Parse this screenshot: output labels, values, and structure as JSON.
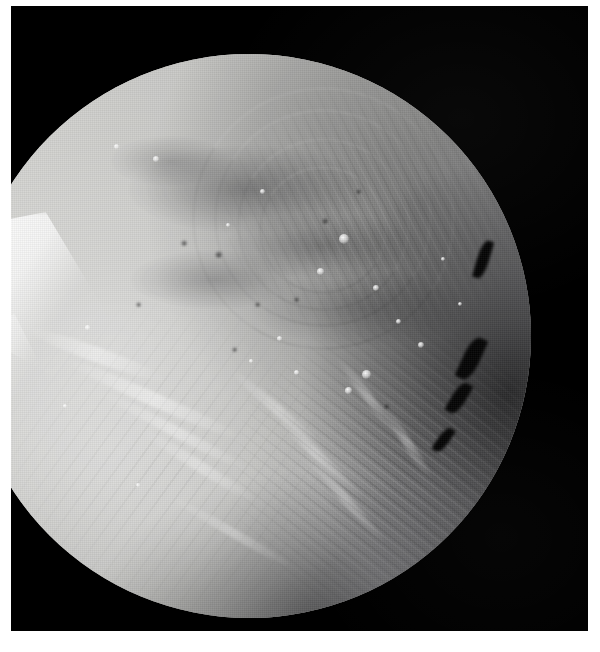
{
  "page": {
    "width": 600,
    "height": 652,
    "background_color": "#ffffff",
    "margin_color": "#ffffff",
    "caption": ""
  },
  "image": {
    "kind": "photograph",
    "subject": "planetary-moon",
    "color_mode": "grayscale",
    "frame": {
      "left": 11,
      "top": 6,
      "width": 577,
      "height": 625,
      "background_color": "#000000"
    },
    "body": {
      "shape": "sphere",
      "center_x": 238,
      "center_y": 330,
      "radius": 282,
      "base_color": "#b9b9b7",
      "highlight_color": "#e8e8e6",
      "shadow_color": "#2a2a2c",
      "illumination_direction": "upper-left",
      "terminator_side": "right"
    },
    "features": {
      "bright_chevron": {
        "name": "bright-scarp-chevron",
        "position": "west-limb-upper",
        "brightness": "#ffffff"
      },
      "dark_bands": {
        "name": "dark-corona-banding",
        "position": "upper-middle",
        "brightness": "#6f6f73"
      },
      "grooved_terrain_ne": {
        "name": "ridged-grooved-terrain",
        "position": "northeast"
      },
      "grooved_terrain_se": {
        "name": "ridged-grooved-terrain",
        "position": "southeast-limb"
      },
      "smooth_plain": {
        "name": "bright-smooth-plain",
        "position": "southwest"
      }
    },
    "bright_spots": [
      {
        "x": 66,
        "y": 32,
        "size": 10
      },
      {
        "x": 62,
        "y": 38,
        "size": 7
      },
      {
        "x": 72,
        "y": 41,
        "size": 6
      },
      {
        "x": 76,
        "y": 47,
        "size": 5
      },
      {
        "x": 80,
        "y": 51,
        "size": 6
      },
      {
        "x": 70,
        "y": 56,
        "size": 9
      },
      {
        "x": 67,
        "y": 59,
        "size": 7
      },
      {
        "x": 58,
        "y": 56,
        "size": 5
      },
      {
        "x": 52,
        "y": 24,
        "size": 5
      },
      {
        "x": 33,
        "y": 18,
        "size": 6
      },
      {
        "x": 26,
        "y": 16,
        "size": 5
      },
      {
        "x": 21,
        "y": 48,
        "size": 5
      },
      {
        "x": 17,
        "y": 62,
        "size": 4
      },
      {
        "x": 30,
        "y": 76,
        "size": 4
      },
      {
        "x": 46,
        "y": 30,
        "size": 4
      },
      {
        "x": 84,
        "y": 36,
        "size": 4
      },
      {
        "x": 87,
        "y": 44,
        "size": 4
      },
      {
        "x": 50,
        "y": 54,
        "size": 4
      },
      {
        "x": 55,
        "y": 50,
        "size": 5
      }
    ],
    "dark_pits": [
      {
        "x": 44,
        "y": 35,
        "size": 7
      },
      {
        "x": 38,
        "y": 33,
        "size": 6
      },
      {
        "x": 51,
        "y": 44,
        "size": 5
      },
      {
        "x": 58,
        "y": 43,
        "size": 5
      },
      {
        "x": 63,
        "y": 29,
        "size": 6
      },
      {
        "x": 47,
        "y": 52,
        "size": 5
      },
      {
        "x": 74,
        "y": 62,
        "size": 5
      },
      {
        "x": 30,
        "y": 44,
        "size": 5
      },
      {
        "x": 69,
        "y": 24,
        "size": 5
      }
    ],
    "terminator_notches": [
      {
        "x": 90.5,
        "y": 33,
        "w": 2.2,
        "h": 7.0,
        "rotate": 16
      },
      {
        "x": 88.0,
        "y": 50,
        "w": 3.0,
        "h": 8.0,
        "rotate": 24
      },
      {
        "x": 86.0,
        "y": 58,
        "w": 2.4,
        "h": 6.0,
        "rotate": 30
      },
      {
        "x": 83.5,
        "y": 66,
        "w": 2.0,
        "h": 5.0,
        "rotate": 34
      }
    ],
    "corona_arcs": [
      {
        "left": 40,
        "top": 6,
        "w": 46,
        "h": 46,
        "border": 1.6,
        "rotate": -12
      },
      {
        "left": 44,
        "top": 10,
        "w": 38,
        "h": 38,
        "border": 1.4,
        "rotate": -12
      },
      {
        "left": 48,
        "top": 15,
        "w": 30,
        "h": 30,
        "border": 1.2,
        "rotate": -12
      },
      {
        "left": 52,
        "top": 20,
        "w": 22,
        "h": 22,
        "border": 1.0,
        "rotate": -12
      }
    ],
    "ridges": [
      {
        "left": 16,
        "top": 60,
        "w": 34,
        "h": 2.4,
        "rotate": 24,
        "opacity": 0.55
      },
      {
        "left": 22,
        "top": 66,
        "w": 30,
        "h": 2.0,
        "rotate": 28,
        "opacity": 0.45
      },
      {
        "left": 28,
        "top": 72,
        "w": 26,
        "h": 2.0,
        "rotate": 32,
        "opacity": 0.4
      },
      {
        "left": 10,
        "top": 52,
        "w": 26,
        "h": 2.6,
        "rotate": 20,
        "opacity": 0.5
      },
      {
        "left": 44,
        "top": 62,
        "w": 22,
        "h": 1.8,
        "rotate": 40,
        "opacity": 0.4
      },
      {
        "left": 50,
        "top": 70,
        "w": 24,
        "h": 1.8,
        "rotate": 44,
        "opacity": 0.42
      },
      {
        "left": 56,
        "top": 78,
        "w": 22,
        "h": 1.6,
        "rotate": 48,
        "opacity": 0.4
      },
      {
        "left": 34,
        "top": 84,
        "w": 26,
        "h": 1.6,
        "rotate": 30,
        "opacity": 0.35
      },
      {
        "left": 62,
        "top": 60,
        "w": 18,
        "h": 1.6,
        "rotate": 52,
        "opacity": 0.38
      },
      {
        "left": 70,
        "top": 68,
        "w": 16,
        "h": 1.6,
        "rotate": 56,
        "opacity": 0.4
      }
    ]
  }
}
